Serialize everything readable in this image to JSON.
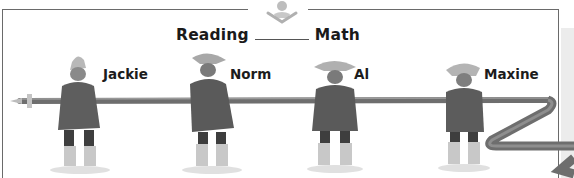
{
  "header": {
    "left_word": "Reading",
    "right_word": "Math",
    "logo_icon": "reader-with-open-book-icon"
  },
  "characters": [
    {
      "name": "Jackie"
    },
    {
      "name": "Norm"
    },
    {
      "name": "Al"
    },
    {
      "name": "Maxine"
    }
  ],
  "colors": {
    "frame": "#6a6a6a",
    "text": "#1a1a1a",
    "pole": "#6e6e6e",
    "coat": "#5e5e5e",
    "hat": "#b8b8b8",
    "boots": "#c8c8c8",
    "background": "#ffffff"
  }
}
